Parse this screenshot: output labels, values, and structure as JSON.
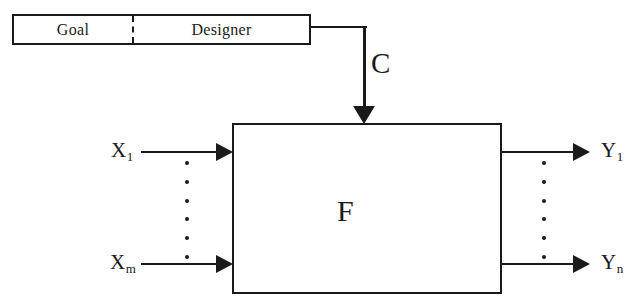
{
  "diagram": {
    "control_box": {
      "goal_label": "Goal",
      "designer_label": "Designer",
      "divider_style": "dashed"
    },
    "control_signal": {
      "label": "C",
      "direction": "down",
      "from": "Designer",
      "to": "F"
    },
    "process_block": {
      "label": "F"
    },
    "inputs": {
      "first_label": "X",
      "first_subscript": "1",
      "last_label": "X",
      "last_subscript": "m",
      "ellipsis_dots": 6
    },
    "outputs": {
      "first_label": "Y",
      "first_subscript": "1",
      "last_label": "Y",
      "last_subscript": "n",
      "ellipsis_dots": 6
    },
    "colors": {
      "stroke": "#1a1a1a",
      "background": "#ffffff"
    }
  }
}
